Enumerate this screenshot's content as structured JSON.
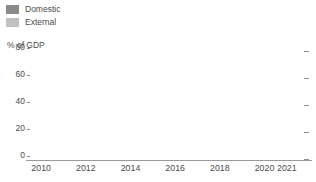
{
  "legend": {
    "position": "top-left",
    "items": [
      {
        "label": "Domestic",
        "color": "#8a8a8a",
        "swatch_icon": "square-swatch"
      },
      {
        "label": "External",
        "color": "#c0c0c0",
        "swatch_icon": "square-swatch"
      }
    ]
  },
  "axis": {
    "unit_caption": "% of GDP",
    "y_ticks": [
      "0",
      "20",
      "40",
      "60",
      "80"
    ],
    "x_tick_labels": [
      "2010",
      "2012",
      "2014",
      "2016",
      "2018",
      "2020",
      "2021"
    ]
  },
  "chart_data": {
    "type": "bar",
    "subtype": "stacked-vertical",
    "title": "",
    "subtitle": "",
    "xlabel": "",
    "ylabel": "% of GDP",
    "ylim": [
      0,
      80
    ],
    "yticks": [
      0,
      20,
      40,
      60,
      80
    ],
    "grid": false,
    "legend_position": "top-left",
    "legend_entries": [
      "Domestic",
      "External"
    ],
    "categories": [
      "2010",
      "2011",
      "2012",
      "2013",
      "2014",
      "2015",
      "2016",
      "2017",
      "2018",
      "2019",
      "2020",
      "2021"
    ],
    "visible_tick_labels": [
      "2010",
      "2012",
      "2014",
      "2016",
      "2018",
      "2020",
      "2021"
    ],
    "series": [
      {
        "name": "Domestic",
        "color": "#8a8a8a",
        "values": [
          31,
          32,
          33,
          32,
          30,
          27,
          28,
          26,
          27,
          29,
          34,
          38
        ]
      },
      {
        "name": "External",
        "color": "#c0c0c0",
        "values": [
          16,
          17,
          16,
          13,
          11,
          14,
          10,
          11,
          11,
          7,
          20,
          19
        ]
      }
    ],
    "totals": [
      47,
      49,
      49,
      45,
      41,
      41,
      38,
      37,
      38,
      36,
      54,
      57
    ],
    "annotations": []
  },
  "colors": {
    "domestic": "#8a8a8a",
    "external": "#c0c0c0",
    "text": "#4b4b4b",
    "axis_line": "#9a9a9a",
    "tick_mark": "#8d8d8d",
    "background": "#ffffff"
  }
}
